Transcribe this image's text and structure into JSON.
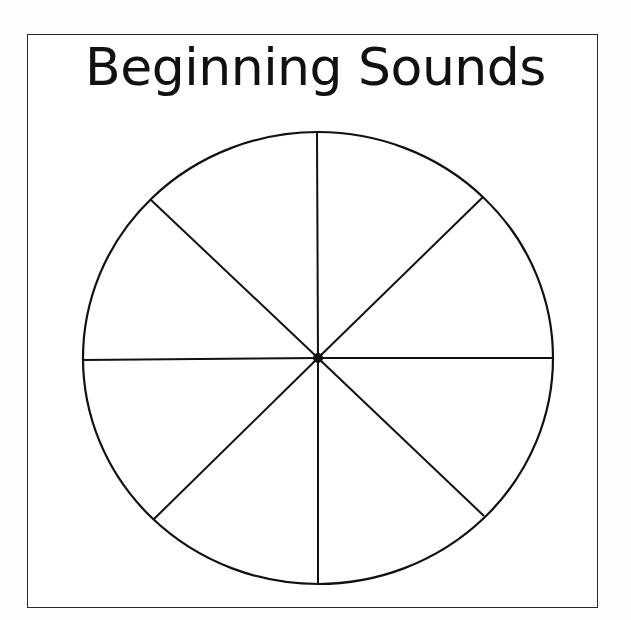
{
  "worksheet": {
    "title": "Beginning Sounds",
    "spinner": {
      "sections": 8,
      "center": {
        "x": 318,
        "y": 358
      },
      "radius_x": 235,
      "radius_y": 226,
      "center_dot_radius": 5,
      "spoke_endpoints": [
        {
          "x": 317,
          "y": 132
        },
        {
          "x": 483,
          "y": 197
        },
        {
          "x": 553,
          "y": 358
        },
        {
          "x": 484,
          "y": 516
        },
        {
          "x": 318,
          "y": 583
        },
        {
          "x": 154,
          "y": 519
        },
        {
          "x": 83,
          "y": 360
        },
        {
          "x": 151,
          "y": 200
        }
      ],
      "segment_labels": [
        "",
        "",
        "",
        "",
        "",
        "",
        "",
        ""
      ]
    },
    "colors": {
      "line": "#111111",
      "paper": "#ffffff",
      "background": "#fdfdfd"
    }
  }
}
